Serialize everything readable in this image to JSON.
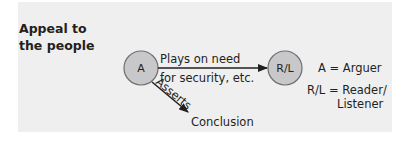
{
  "title": {
    "line1": "Appeal to",
    "line2": "the people"
  },
  "nodes": {
    "arguer": {
      "label": "A"
    },
    "reader": {
      "label": "R/L"
    }
  },
  "edges": {
    "plays_on": {
      "line1": "Plays on need",
      "line2": "for security, etc."
    },
    "asserts": {
      "label": "Asserts"
    }
  },
  "conclusion": {
    "label": "Conclusion"
  },
  "legend": {
    "arguer": "A = Arguer",
    "reader_line1": "R/L = Reader/",
    "reader_line2": "Listener"
  },
  "colors": {
    "panel": "#efeff0",
    "node_fill": "#c8c8ca",
    "node_stroke": "#6d6e71",
    "text": "#231f20"
  }
}
